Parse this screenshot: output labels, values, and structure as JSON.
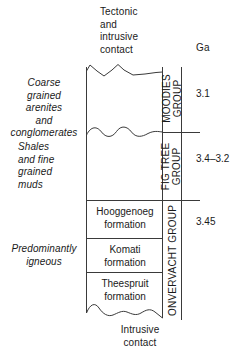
{
  "figure": {
    "type": "stratigraphic-column",
    "top_contact_caption": "Tectonic\nand\nintrusive\ncontact",
    "bottom_contact_caption": "Intrusive\ncontact",
    "age_column_header": "Ga"
  },
  "lithology_descriptions": [
    {
      "id": "coarse",
      "text": "Coarse\ngrained\narenites\nand\nconglomerates"
    },
    {
      "id": "shales",
      "text": "Shales\nand fine\ngrained\nmuds"
    },
    {
      "id": "igneous",
      "text": "Predominantly\nigneous"
    }
  ],
  "groups": [
    {
      "id": "moodies",
      "label": "MOODIES\nGROUP",
      "age": "3.1"
    },
    {
      "id": "figtree",
      "label": "FIG TREE\nGROUP",
      "age": "3.4–3.2"
    },
    {
      "id": "onverwacht",
      "label": "ONVERVACHT GROUP",
      "age": "3.45"
    }
  ],
  "formations": [
    {
      "id": "hooggenoeg",
      "name": "Hooggenoeg\nformation"
    },
    {
      "id": "komati",
      "name": "Komati\nformation"
    },
    {
      "id": "theespruit",
      "name": "Theespruit\nformation"
    }
  ],
  "colors": {
    "stroke": "#3a3a3a",
    "text": "#1a1a1a",
    "background": "#ffffff"
  }
}
